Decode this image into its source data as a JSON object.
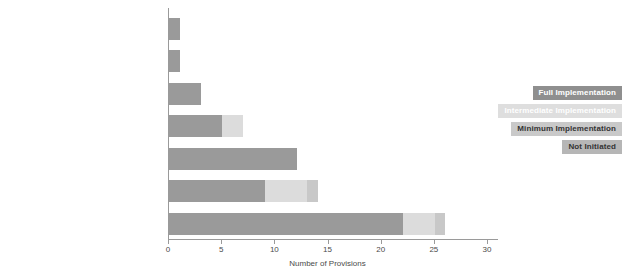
{
  "chart_data": {
    "type": "bar",
    "subtype": "horizontal-stacked",
    "title": "",
    "xlabel": "Number of Provisions",
    "ylabel": "",
    "xlim": [
      0,
      30
    ],
    "xticks": [
      0,
      5,
      10,
      15,
      20,
      25,
      30
    ],
    "xtick_labels": [
      "0",
      "5",
      "10",
      "15",
      "20",
      "25",
      "30"
    ],
    "grid": false,
    "legend_position": "right",
    "categories": [
      "Commission to Address Damage and Loss",
      "International Arbitration on Land",
      "UN Transitional Authority",
      "Regional Peacekeeping Force",
      "UN Peacekeeping Force",
      "Withdrawal of Troops",
      "UN, International, or Internal Verification"
    ],
    "series": [
      {
        "name": "Full Implementation",
        "color": "#9a9a9a",
        "values": [
          1,
          1,
          3,
          5,
          12,
          9,
          22
        ]
      },
      {
        "name": "Intermediate Implementation",
        "color": "#dcdcdc",
        "values": [
          0,
          0,
          0,
          2,
          0,
          4,
          3
        ]
      },
      {
        "name": "Minimum Implementation",
        "color": "#c9c9c9",
        "values": [
          0,
          0,
          0,
          0,
          0,
          0,
          0
        ]
      },
      {
        "name": "Not Initiated",
        "color": "#b4b4b4",
        "values": [
          0,
          0,
          0,
          0,
          0,
          1,
          1
        ]
      }
    ],
    "totals": [
      1,
      1,
      3,
      7,
      12,
      14,
      26
    ]
  },
  "legend": {
    "items": [
      {
        "label": "Full Implementation"
      },
      {
        "label": "Intermediate Implementation"
      },
      {
        "label": "Minimum Implementation"
      },
      {
        "label": "Not Initiated"
      }
    ]
  }
}
